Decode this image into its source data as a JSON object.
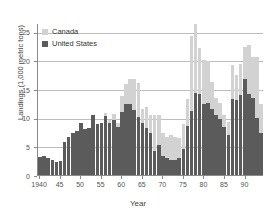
{
  "chart_data": {
    "type": "bar",
    "stacked": true,
    "title": "",
    "xlabel": "Year",
    "ylabel": "Landings (1,000 metric tons)",
    "ylim": [
      0,
      26.5
    ],
    "yticks": [
      0,
      5,
      10,
      15,
      20,
      25
    ],
    "ytick_labels": [
      "0",
      "5",
      "10",
      "15",
      "20",
      "25"
    ],
    "xtick_years": [
      1940,
      1945,
      1950,
      1955,
      1960,
      1965,
      1970,
      1975,
      1980,
      1985,
      1990
    ],
    "xtick_labels": [
      "1940",
      "45",
      "50",
      "55",
      "60",
      "65",
      "70",
      "75",
      "80",
      "85",
      "90"
    ],
    "grid": "horizontal",
    "legend_position": "top-left",
    "colors": {
      "Canada": "#d2d2d2",
      "United States": "#5b5b5b",
      "gridline": "#bdbdbd",
      "axis": "#8a8a8a"
    },
    "categories": [
      1940,
      1941,
      1942,
      1943,
      1944,
      1945,
      1946,
      1947,
      1948,
      1949,
      1950,
      1951,
      1952,
      1953,
      1954,
      1955,
      1956,
      1957,
      1958,
      1959,
      1960,
      1961,
      1962,
      1963,
      1964,
      1965,
      1966,
      1967,
      1968,
      1969,
      1970,
      1971,
      1972,
      1973,
      1974,
      1975,
      1976,
      1977,
      1978,
      1979,
      1980,
      1981,
      1982,
      1983,
      1984,
      1985,
      1986,
      1987,
      1988,
      1989,
      1990,
      1991,
      1992,
      1993,
      1994
    ],
    "series": [
      {
        "name": "United States",
        "values": [
          3.2,
          3.4,
          2.9,
          2.6,
          2.2,
          2.5,
          5.7,
          6.6,
          7.4,
          7.6,
          9.0,
          8.1,
          8.2,
          10.5,
          8.9,
          9.1,
          10.3,
          9.0,
          9.6,
          8.4,
          11.0,
          12.4,
          12.3,
          11.3,
          10.2,
          9.0,
          8.2,
          7.3,
          4.1,
          5.3,
          3.4,
          2.9,
          2.7,
          2.6,
          3.0,
          4.5,
          8.6,
          11.1,
          14.4,
          14.2,
          12.4,
          12.6,
          11.5,
          10.4,
          9.8,
          8.3,
          7.0,
          13.2,
          13.0,
          14.0,
          16.7,
          14.2,
          13.4,
          10.0,
          7.4
        ]
      },
      {
        "name": "Canada",
        "values": [
          0.0,
          0.0,
          0.0,
          0.0,
          0.0,
          0.0,
          0.0,
          0.0,
          0.0,
          0.0,
          0.0,
          0.0,
          0.0,
          0.0,
          0.0,
          0.0,
          0.5,
          0.6,
          1.0,
          0.6,
          2.8,
          3.4,
          4.4,
          5.4,
          5.8,
          2.5,
          3.6,
          3.2,
          6.4,
          5.1,
          4.0,
          3.7,
          4.3,
          4.1,
          3.4,
          4.4,
          4.6,
          13.1,
          12.0,
          7.9,
          7.7,
          7.2,
          4.8,
          3.0,
          2.7,
          2.2,
          2.3,
          5.9,
          4.5,
          5.4,
          5.7,
          8.4,
          7.1,
          10.6,
          5.0
        ]
      }
    ]
  },
  "legend": {
    "items": [
      {
        "label": "Canada",
        "color": "#d2d2d2"
      },
      {
        "label": "United States",
        "color": "#5b5b5b"
      }
    ]
  },
  "axes": {
    "x_title": "Year",
    "y_title": "Landings (1,000 metric tons)"
  }
}
